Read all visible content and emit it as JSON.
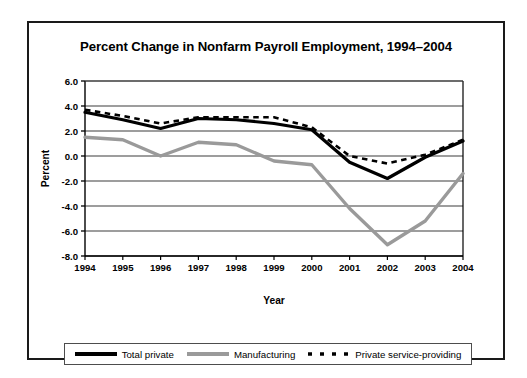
{
  "chart_data": {
    "type": "line",
    "title": "Percent Change in Nonfarm Payroll Employment, 1994–2004",
    "xlabel": "Year",
    "ylabel": "Percent",
    "categories": [
      "1994",
      "1995",
      "1996",
      "1997",
      "1998",
      "1999",
      "2000",
      "2001",
      "2002",
      "2003",
      "2004"
    ],
    "x": [
      1994,
      1995,
      1996,
      1997,
      1998,
      1999,
      2000,
      2001,
      2002,
      2003,
      2004
    ],
    "ylim": [
      -8.0,
      6.0
    ],
    "ytick_labels": [
      "6.0",
      "4.0",
      "2.0",
      "0.0",
      "-2.0",
      "-4.0",
      "-6.0",
      "-8.0"
    ],
    "yticks": [
      6.0,
      4.0,
      2.0,
      0.0,
      -2.0,
      -4.0,
      -6.0,
      -8.0
    ],
    "grid": "horizontal",
    "legend_position": "bottom",
    "series": [
      {
        "name": "Total private",
        "style": "solid",
        "color": "#000000",
        "width": 3.2,
        "values": [
          3.5,
          2.9,
          2.2,
          3.0,
          2.9,
          2.6,
          2.1,
          -0.5,
          -1.8,
          -0.1,
          1.2
        ]
      },
      {
        "name": "Manufacturing",
        "style": "solid",
        "color": "#9a9a9a",
        "width": 3.4,
        "values": [
          1.5,
          1.3,
          0.0,
          1.1,
          0.9,
          -0.4,
          -0.7,
          -4.2,
          -7.1,
          -5.2,
          -1.4
        ]
      },
      {
        "name": "Private service-providing",
        "style": "dashed",
        "color": "#000000",
        "width": 2.6,
        "values": [
          3.7,
          3.2,
          2.6,
          3.1,
          3.1,
          3.1,
          2.3,
          0.0,
          -0.6,
          0.1,
          1.3
        ]
      }
    ]
  },
  "legend": {
    "items": [
      {
        "label": "Total private",
        "swatch": "solid-black-line"
      },
      {
        "label": "Manufacturing",
        "swatch": "solid-gray-line"
      },
      {
        "label": "Private service-providing",
        "swatch": "dashed-black-line"
      }
    ]
  }
}
